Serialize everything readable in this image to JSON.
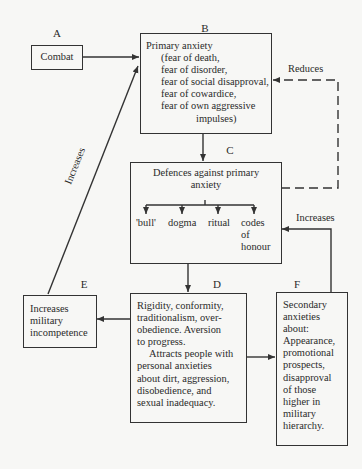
{
  "diagram": {
    "type": "flowchart",
    "nodes": {
      "A": {
        "id_label": "A",
        "lines": [
          "Combat"
        ]
      },
      "B": {
        "id_label": "B",
        "lines": [
          "Primary anxiety",
          "(fear of death,",
          "fear of disorder,",
          "fear of social disapproval,",
          "fear of cowardice,",
          "fear of own aggressive",
          "impulses)"
        ]
      },
      "C": {
        "id_label": "C",
        "title_lines": [
          "Defences against primary",
          "anxiety"
        ],
        "defences": [
          "'bull'",
          "dogma",
          "ritual",
          "codes of honour"
        ],
        "codes_lines": [
          "codes",
          "of",
          "honour"
        ]
      },
      "D": {
        "id_label": "D",
        "lines": [
          "Rigidity, conformity,",
          "traditionalism, over-",
          "obedience. Aversion",
          "to progress.",
          "Attracts people with",
          "personal anxieties",
          "about dirt, aggression,",
          "disobedience, and",
          "sexual inadequacy."
        ]
      },
      "E": {
        "id_label": "E",
        "lines": [
          "Increases",
          "military",
          "incompetence"
        ]
      },
      "F": {
        "id_label": "F",
        "lines": [
          "Secondary",
          "anxieties",
          "about:",
          "Appearance,",
          "promotional",
          "prospects,",
          "disapproval",
          "of those",
          "higher in",
          "military",
          "hierarchy."
        ]
      }
    },
    "edges": [
      {
        "from": "A",
        "to": "B",
        "label": ""
      },
      {
        "from": "B",
        "to": "C",
        "label": ""
      },
      {
        "from": "C",
        "to": "B",
        "label": "Reduces",
        "style": "dashed"
      },
      {
        "from": "C",
        "to": "D",
        "label": ""
      },
      {
        "from": "D",
        "to": "E",
        "label": ""
      },
      {
        "from": "D",
        "to": "F",
        "label": ""
      },
      {
        "from": "F",
        "to": "C",
        "label": "Increases"
      },
      {
        "from": "E",
        "to": "B",
        "label": "Increases"
      }
    ],
    "edge_labels": {
      "reduces": "Reduces",
      "increases_f_to_c": "Increases",
      "increases_e_to_b": "Increases"
    }
  }
}
